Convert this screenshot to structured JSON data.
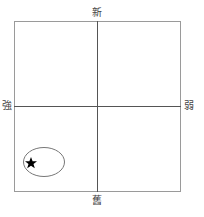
{
  "diagram": {
    "type": "quadrant-matrix",
    "axes": {
      "top": "新",
      "bottom": "舊",
      "left": "強",
      "right": "弱"
    },
    "marker": {
      "icon": "star-icon",
      "quadrant": "bottom-left",
      "highlight": "ellipse"
    },
    "colors": {
      "frame": "#9a9a9a",
      "axis": "#555555",
      "ellipse": "#777777",
      "star": "#000000"
    }
  }
}
